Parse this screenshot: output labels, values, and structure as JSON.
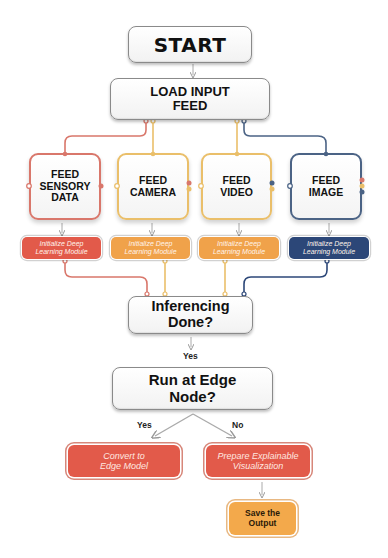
{
  "diagram": {
    "start": {
      "label": "START"
    },
    "load": {
      "label": "LOAD INPUT FEED",
      "line1": "LOAD INPUT",
      "line2": "FEED"
    },
    "feeds": [
      {
        "line1": "FEED",
        "line2": "SENSORY",
        "line3": "DATA",
        "color": "#d9776b"
      },
      {
        "line1": "FEED",
        "line2": "CAMERA",
        "line3": "",
        "color": "#eabf6a"
      },
      {
        "line1": "FEED",
        "line2": "VIDEO",
        "line3": "",
        "color": "#eabf6a"
      },
      {
        "line1": "FEED",
        "line2": "IMAGE",
        "line3": "",
        "color": "#4b6385"
      }
    ],
    "init_modules": [
      {
        "line1": "Initialize Deep",
        "line2": "Learning Module",
        "color": "#e25a4a"
      },
      {
        "line1": "Initialize Deep",
        "line2": "Learning Module",
        "color": "#f0a24a"
      },
      {
        "line1": "Initialize Deep",
        "line2": "Learning Module",
        "color": "#f0a24a"
      },
      {
        "line1": "Initialize Deep",
        "line2": "Learning Module",
        "color": "#2c4778"
      }
    ],
    "inferencing": {
      "line1": "Inferencing",
      "line2": "Done?",
      "yes_label": "Yes"
    },
    "edge_decision": {
      "line1": "Run at Edge",
      "line2": "Node?",
      "yes_label": "Yes",
      "no_label": "No"
    },
    "convert": {
      "line1": "Convert to",
      "line2": "Edge Model"
    },
    "prepare": {
      "line1": "Prepare Explainable",
      "line2": "Visualization"
    },
    "save": {
      "line1": "Save the",
      "line2": "Output"
    },
    "colors": {
      "red": "#e25a4a",
      "orange": "#f0a24a",
      "navy": "#2c4778",
      "save_fill": "#f3a94b"
    }
  }
}
